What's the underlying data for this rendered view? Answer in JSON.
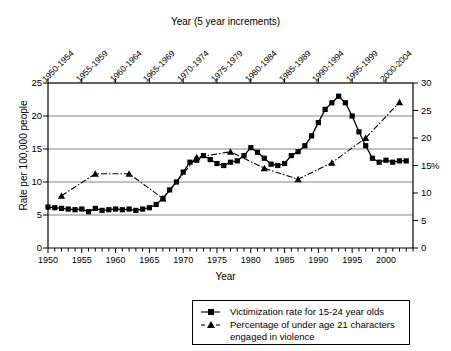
{
  "chart_data": {
    "type": "line",
    "title": "",
    "top_axis_label": "Year (5 year increments)",
    "xlabel": "Year",
    "ylabel": "Rate per 100,000 people",
    "ylabel_right": "%",
    "xlim": [
      1950,
      2004
    ],
    "ylim": [
      0,
      25
    ],
    "ylim_right": [
      0,
      30
    ],
    "grid": true,
    "legend_position": "bottom-right",
    "yticks": [
      0,
      5,
      10,
      15,
      20,
      25
    ],
    "yticks_right": [
      0,
      5,
      10,
      15,
      20,
      25,
      30
    ],
    "xticks": [
      1950,
      1955,
      1960,
      1965,
      1970,
      1975,
      1980,
      1985,
      1990,
      1995,
      2000
    ],
    "top_tick_labels": [
      "1950-1954",
      "1955-1959",
      "1960-1964",
      "1965-1969",
      "1970-1974",
      "1975-1979",
      "1980-1984",
      "1985-1989",
      "1990-1994",
      "1995-1999",
      "2000-2004"
    ],
    "series": [
      {
        "name": "Victimization rate for 15-24 year olds",
        "marker": "square",
        "linestyle": "solid",
        "axis": "left",
        "color": "#000000",
        "x": [
          1950,
          1951,
          1952,
          1953,
          1954,
          1955,
          1956,
          1957,
          1958,
          1959,
          1960,
          1961,
          1962,
          1963,
          1964,
          1965,
          1966,
          1967,
          1968,
          1969,
          1970,
          1971,
          1972,
          1973,
          1974,
          1975,
          1976,
          1977,
          1978,
          1979,
          1980,
          1981,
          1982,
          1983,
          1984,
          1985,
          1986,
          1987,
          1988,
          1989,
          1990,
          1991,
          1992,
          1993,
          1994,
          1995,
          1996,
          1997,
          1998,
          1999,
          2000,
          2001,
          2002,
          2003
        ],
        "y": [
          6.2,
          6.1,
          6.0,
          5.9,
          5.8,
          5.9,
          5.5,
          6.0,
          5.7,
          5.8,
          5.9,
          5.8,
          5.9,
          5.7,
          5.9,
          6.1,
          6.6,
          7.5,
          8.8,
          10.0,
          11.5,
          13.0,
          13.3,
          14.0,
          13.4,
          12.8,
          12.5,
          13.0,
          13.2,
          14.0,
          15.2,
          14.5,
          13.6,
          12.7,
          12.5,
          12.8,
          14.0,
          14.6,
          15.5,
          17.0,
          19.0,
          21.0,
          22.0,
          23.0,
          22.0,
          20.0,
          17.6,
          15.5,
          13.6,
          13.0,
          13.3,
          13.0,
          13.2,
          13.2
        ]
      },
      {
        "name": "Percentage of under age 21 characters engaged in violence",
        "marker": "triangle",
        "linestyle": "dash-dot",
        "axis": "right",
        "color": "#000000",
        "x": [
          1952,
          1957,
          1962,
          1967,
          1972,
          1977,
          1982,
          1987,
          1992,
          1997,
          2002
        ],
        "y": [
          9.5,
          13.5,
          13.5,
          9.0,
          16.5,
          17.5,
          14.5,
          12.5,
          15.5,
          20.0,
          26.5
        ]
      }
    ]
  },
  "legend": {
    "items": [
      {
        "label": "Victimization rate for 15-24 year olds",
        "marker": "square",
        "line": "solid"
      },
      {
        "label": "Percentage of under age 21 characters",
        "label2": "engaged in violence",
        "marker": "triangle",
        "line": "dash-dot"
      }
    ]
  }
}
